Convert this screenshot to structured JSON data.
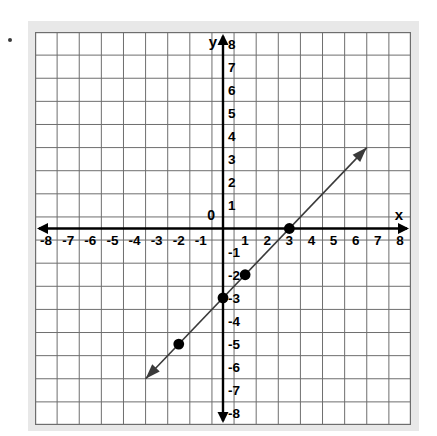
{
  "figure": {
    "bullet_marker": "•",
    "background_color": "#e8e8e8",
    "plot_background_color": "#ffffff",
    "grid_color": "#6e6e6e",
    "axis_color": "#000000",
    "line_color": "#3a3a3a",
    "point_color": "#000000"
  },
  "labels": {
    "x_axis": "x",
    "y_axis": "y",
    "origin": "0"
  },
  "chart_data": {
    "type": "line",
    "title": "",
    "xlabel": "x",
    "ylabel": "y",
    "xlim": [
      -8,
      8
    ],
    "ylim": [
      -8,
      8
    ],
    "grid": true,
    "legend": "none",
    "x_ticks": [
      -8,
      -7,
      -6,
      -5,
      -4,
      -3,
      -2,
      -1,
      1,
      2,
      3,
      4,
      5,
      6,
      7,
      8
    ],
    "y_ticks": [
      8,
      7,
      6,
      5,
      4,
      3,
      2,
      1,
      -1,
      -2,
      -3,
      -4,
      -5,
      -6,
      -7,
      -8
    ],
    "x_tick_labels": [
      "-8",
      "-7",
      "-6",
      "-5",
      "-4",
      "-3",
      "-2",
      "-1",
      "1",
      "2",
      "3",
      "4",
      "5",
      "6",
      "7",
      "8"
    ],
    "y_tick_labels": [
      "8",
      "7",
      "6",
      "5",
      "4",
      "3",
      "2",
      "1",
      "-1",
      "-2",
      "-3",
      "-4",
      "-5",
      "-6",
      "-7",
      "-8"
    ],
    "series": [
      {
        "name": "line",
        "equation": "y = x - 3",
        "slope": 1,
        "y_intercept": -3,
        "x_intercept": 3,
        "arrow_start": [
          -3.5,
          -6.5
        ],
        "arrow_end": [
          6.5,
          3.5
        ],
        "double_arrow": true,
        "points": [
          {
            "x": -2,
            "y": -5
          },
          {
            "x": 0,
            "y": -3
          },
          {
            "x": 1,
            "y": -2
          },
          {
            "x": 3,
            "y": 0
          }
        ]
      }
    ]
  }
}
